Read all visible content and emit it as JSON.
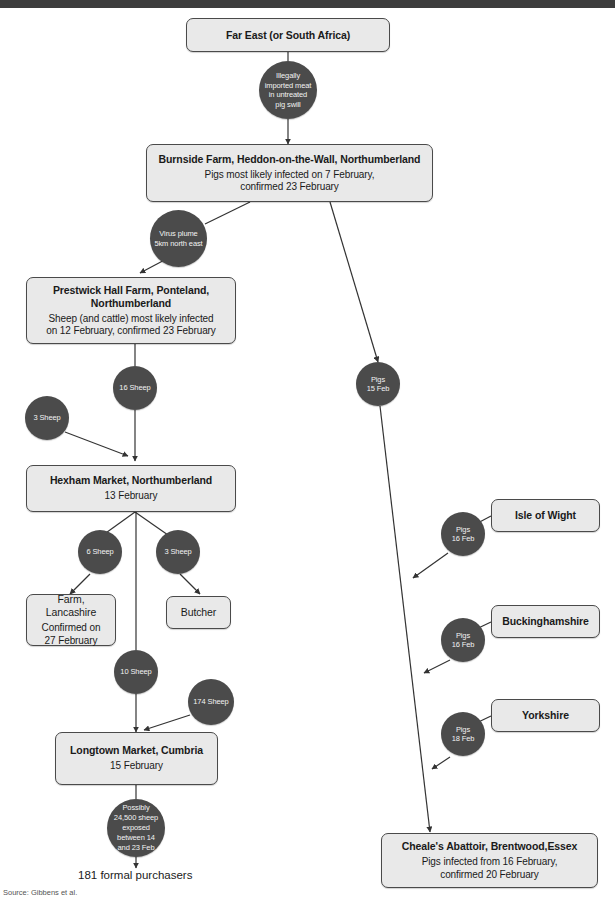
{
  "diagram": {
    "source": "Source: Gibbens et al.",
    "colors": {
      "box_fill": "#e9e9e9",
      "box_border": "#4a4a4a",
      "circle_fill": "#4b4b4b",
      "circle_text": "#f2f2f2",
      "edge": "#333333",
      "topbar": "#3d3d3d"
    },
    "free_labels": [
      {
        "id": "purchasers",
        "text": "181 formal purchasers"
      }
    ],
    "boxes": [
      {
        "id": "far-east",
        "title": "Far East (or South Africa)",
        "sub": "",
        "bold": true
      },
      {
        "id": "burnside-farm",
        "title": "Burnside Farm, Heddon-on-the-Wall, Northumberland",
        "sub": "Pigs most likely infected on 7 February,\nconfirmed 23 February",
        "bold": true
      },
      {
        "id": "prestwick-hall-farm",
        "title": "Prestwick Hall Farm, Ponteland,\nNorthumberland",
        "sub": "Sheep (and cattle) most likely infected\non 12 February, confirmed 23 February",
        "bold": true
      },
      {
        "id": "hexham-market",
        "title": "Hexham Market, Northumberland",
        "sub": "13 February",
        "bold": true
      },
      {
        "id": "farm-lancashire",
        "title": "Farm,\nLancashire",
        "sub": "Confirmed on\n27 February",
        "bold": false
      },
      {
        "id": "butcher",
        "title": "Butcher",
        "sub": "",
        "bold": false
      },
      {
        "id": "longtown-market",
        "title": "Longtown Market, Cumbria",
        "sub": "15 February",
        "bold": true
      },
      {
        "id": "isle-of-wight",
        "title": "Isle of Wight",
        "sub": "",
        "bold": true
      },
      {
        "id": "buckinghamshire",
        "title": "Buckinghamshire",
        "sub": "",
        "bold": true
      },
      {
        "id": "yorkshire",
        "title": "Yorkshire",
        "sub": "",
        "bold": true
      },
      {
        "id": "cheales-abattoir",
        "title": "Cheale's Abattoir, Brentwood,Essex",
        "sub": "Pigs infected from 16 February,\nconfirmed 20 February",
        "bold": true
      }
    ],
    "circles": [
      {
        "id": "illegal-meat",
        "text": "Illegally\nimported meat\nin untreated\npig swill"
      },
      {
        "id": "virus-plume",
        "text": "Virus plume\n5km north east"
      },
      {
        "id": "sheep-16",
        "text": "16 Sheep"
      },
      {
        "id": "sheep-3-left",
        "text": "3 Sheep"
      },
      {
        "id": "sheep-6",
        "text": "6 Sheep"
      },
      {
        "id": "sheep-3-right",
        "text": "3 Sheep"
      },
      {
        "id": "sheep-10",
        "text": "10 Sheep"
      },
      {
        "id": "sheep-174",
        "text": "174 Sheep"
      },
      {
        "id": "sheep-exposed",
        "text": "Possibly\n24,500 sheep\nexposed\nbetween 14\nand 23 Feb"
      },
      {
        "id": "pigs-15feb",
        "text": "Pigs\n15 Feb"
      },
      {
        "id": "pigs-16feb-iow",
        "text": "Pigs\n16 Feb"
      },
      {
        "id": "pigs-16feb-bucks",
        "text": "Pigs\n16 Feb"
      },
      {
        "id": "pigs-18feb-yorks",
        "text": "Pigs\n18 Feb"
      }
    ]
  }
}
